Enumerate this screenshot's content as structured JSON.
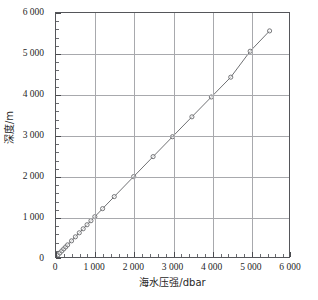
{
  "chart_data": {
    "type": "scatter",
    "title": "",
    "xlabel": "海水压强/dbar",
    "ylabel": "深度/m",
    "xlim": [
      0,
      6000
    ],
    "ylim": [
      0,
      6000
    ],
    "grid": true,
    "legend": false,
    "x_major_step": 1000,
    "y_major_step": 1000,
    "x_minor_step": 200,
    "y_minor_step": 200,
    "xticklabels": [
      "0",
      "1 000",
      "2 000",
      "3 000",
      "4 000",
      "5 000",
      "6 000"
    ],
    "yticklabels": [
      "0",
      "1 000",
      "2 000",
      "3 000",
      "4 000",
      "5 000",
      "6 000"
    ],
    "xticks": [
      0,
      1000,
      2000,
      3000,
      4000,
      5000,
      6000
    ],
    "yticks": [
      0,
      1000,
      2000,
      3000,
      4000,
      5000,
      6000
    ],
    "series": [
      {
        "name": "压强-深度",
        "marker": "open-circle",
        "line_color": "#5e5f63",
        "marker_color": "#5e5f63",
        "x": [
          0,
          50,
          100,
          150,
          200,
          250,
          300,
          400,
          500,
          600,
          700,
          800,
          900,
          1000,
          1200,
          1500,
          2000,
          2500,
          3000,
          3500,
          4000,
          4500,
          5000,
          5500
        ],
        "y": [
          0,
          50,
          100,
          150,
          199,
          248,
          298,
          397,
          496,
          595,
          694,
          793,
          892,
          991,
          1189,
          1485,
          1977,
          2468,
          2958,
          3447,
          3935,
          4422,
          5060,
          5560
        ]
      }
    ]
  }
}
